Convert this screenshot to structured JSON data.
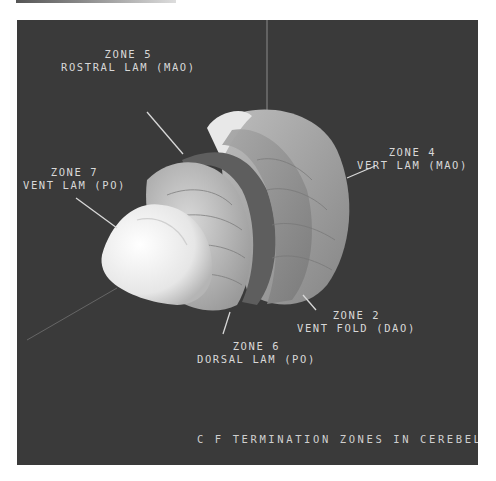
{
  "figure": {
    "caption": "C F TERMINATION ZONES IN CEREBELLAR CTX",
    "background_color": "#3a3a3a",
    "text_color": "#d8d8d8",
    "labels": [
      {
        "zone": "ZONE 5",
        "desc": "ROSTRAL LAM (MAO)"
      },
      {
        "zone": "ZONE 4",
        "desc": "VERT LAM (MAO)"
      },
      {
        "zone": "ZONE 7",
        "desc": "VENT LAM (PO)"
      },
      {
        "zone": "ZONE 2",
        "desc": "VENT FOLD (DAO)"
      },
      {
        "zone": "ZONE 6",
        "desc": "DORSAL LAM (PO)"
      }
    ]
  }
}
